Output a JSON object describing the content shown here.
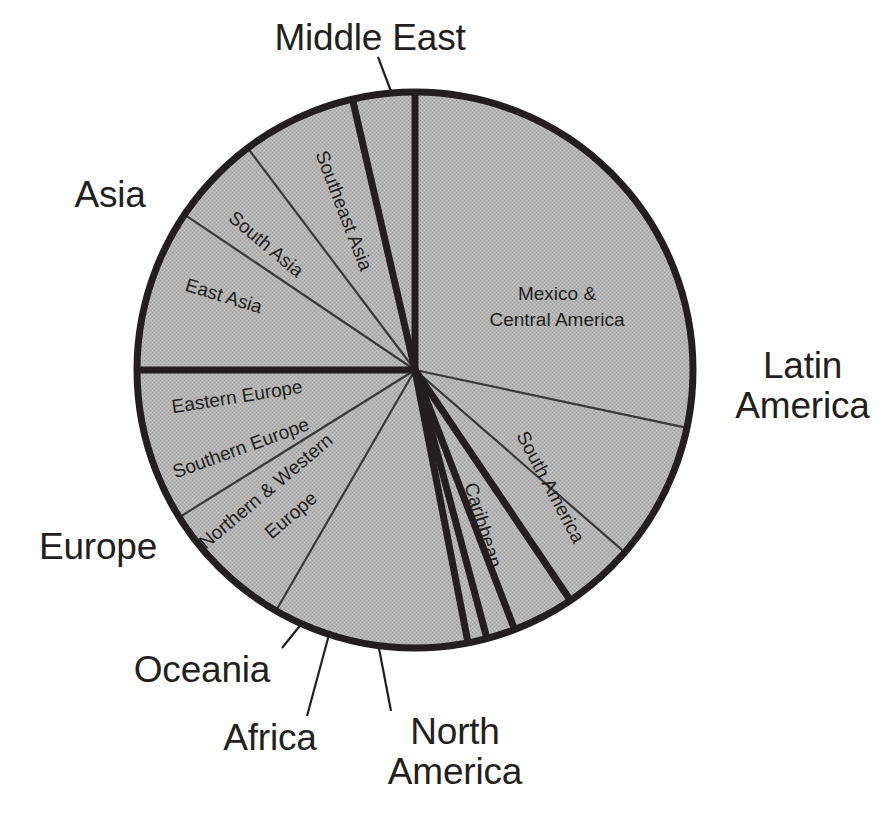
{
  "figure": {
    "type": "pie",
    "colors": {
      "background": "#ffffff",
      "slice_fill": "#b3b3b3",
      "outline": "#231f20",
      "text": "#231f20",
      "thin_divider": "#3a3a3a"
    }
  },
  "outer_labels": [
    {
      "id": "middle-east",
      "text": "Middle East"
    },
    {
      "id": "asia",
      "text": "Asia"
    },
    {
      "id": "europe",
      "text": "Europe"
    },
    {
      "id": "oceania",
      "text": "Oceania"
    },
    {
      "id": "africa",
      "text": "Africa"
    },
    {
      "id": "north-america",
      "text": "North\nAmerica"
    },
    {
      "id": "latin-america",
      "text": "Latin\nAmerica"
    }
  ],
  "slice_labels": [
    {
      "id": "southeast-asia",
      "text": "Southeast Asia"
    },
    {
      "id": "south-asia",
      "text": "South Asia"
    },
    {
      "id": "east-asia",
      "text": "East Asia"
    },
    {
      "id": "eastern-europe",
      "text": "Eastern Europe"
    },
    {
      "id": "southern-europe",
      "text": "Southern Europe"
    },
    {
      "id": "northern-western-europe",
      "text": "Northern & Western"
    },
    {
      "id": "northern-western-europe2",
      "text": "Europe"
    },
    {
      "id": "mexico-central-america1",
      "text": "Mexico &"
    },
    {
      "id": "mexico-central-america2",
      "text": "Central America"
    },
    {
      "id": "caribbean",
      "text": "Caribbean"
    },
    {
      "id": "south-america",
      "text": "South America"
    }
  ],
  "chart_data": {
    "type": "pie",
    "title": "",
    "legend": "none",
    "units": "share of total (percent)",
    "note": "Angles measured clockwise from 12 o'clock. Major regions are separated by heavy rules; sub-regions by thin rules.",
    "groups": [
      {
        "name": "Latin America",
        "value": 40.6,
        "start_deg": 0.0,
        "end_deg": 146.0,
        "subregions": [
          {
            "name": "Mexico & Central America",
            "value": 28.3,
            "start_deg": 0.0,
            "end_deg": 102.0
          },
          {
            "name": "South America",
            "value": 8.1,
            "start_deg": 102.0,
            "end_deg": 131.0
          },
          {
            "name": "Caribbean",
            "value": 4.2,
            "start_deg": 131.0,
            "end_deg": 146.0
          }
        ]
      },
      {
        "name": "North America",
        "value": 3.6,
        "start_deg": 146.0,
        "end_deg": 159.0,
        "subregions": []
      },
      {
        "name": "Africa",
        "value": 1.7,
        "start_deg": 159.0,
        "end_deg": 165.0,
        "subregions": []
      },
      {
        "name": "Oceania",
        "value": 1.1,
        "start_deg": 165.0,
        "end_deg": 169.0,
        "subregions": []
      },
      {
        "name": "Europe",
        "value": 28.1,
        "start_deg": 169.0,
        "end_deg": 270.0,
        "subregions": [
          {
            "name": "Northern & Western Europe",
            "value": 11.4,
            "start_deg": 169.0,
            "end_deg": 210.0
          },
          {
            "name": "Southern Europe",
            "value": 7.8,
            "start_deg": 210.0,
            "end_deg": 238.0
          },
          {
            "name": "Eastern Europe",
            "value": 8.9,
            "start_deg": 238.0,
            "end_deg": 270.0
          }
        ]
      },
      {
        "name": "Asia",
        "value": 21.4,
        "start_deg": 270.0,
        "end_deg": 347.0,
        "subregions": [
          {
            "name": "East Asia",
            "value": 9.4,
            "start_deg": 270.0,
            "end_deg": 304.0
          },
          {
            "name": "South Asia",
            "value": 5.3,
            "start_deg": 304.0,
            "end_deg": 323.0
          },
          {
            "name": "Southeast Asia",
            "value": 6.7,
            "start_deg": 323.0,
            "end_deg": 347.0
          }
        ]
      },
      {
        "name": "Middle East",
        "value": 3.6,
        "start_deg": 347.0,
        "end_deg": 360.0,
        "subregions": []
      }
    ]
  }
}
